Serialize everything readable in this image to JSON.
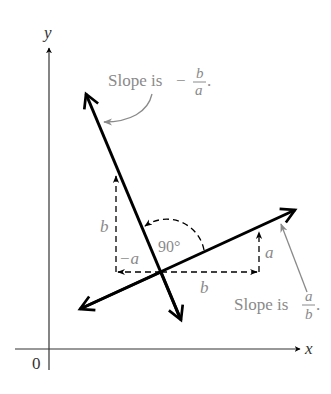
{
  "axes": {
    "x_label": "x",
    "y_label": "y",
    "origin_label": "0"
  },
  "lines": [
    {
      "name": "line-positive-slope",
      "slope_text": "Slope is",
      "numerator": "a",
      "denominator": "b"
    },
    {
      "name": "line-negative-slope",
      "slope_text": "Slope is",
      "sign": "−",
      "numerator": "b",
      "denominator": "a"
    }
  ],
  "angle_label": "90°",
  "run_rise_labels": {
    "b_bottom": "b",
    "a_right": "a",
    "b_left": "b",
    "neg_a": "−a"
  },
  "colors": {
    "line": "#000000",
    "annotation": "#8a8a8a",
    "axis": "#333333"
  }
}
